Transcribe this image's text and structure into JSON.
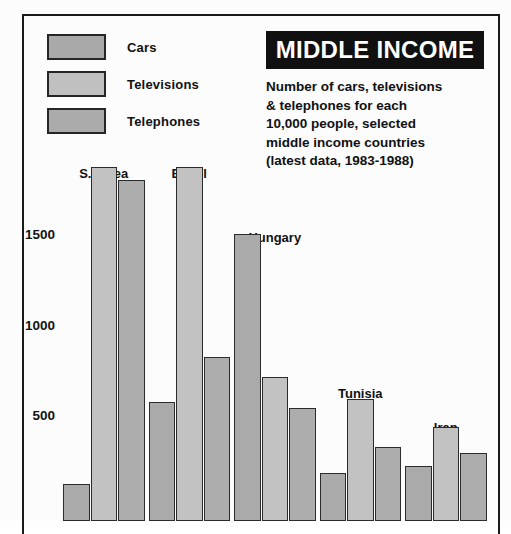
{
  "headline": {
    "title": "MIDDLE INCOME",
    "background": "#101010",
    "text_color": "#ffffff"
  },
  "subtitle": {
    "line1": "Number of cars, televisions",
    "line2": "& telephones for each",
    "line3": "10,000 people, selected",
    "line4": "middle income countries",
    "line5": "(latest data, 1983-1988)"
  },
  "legend": {
    "position": "top-left",
    "items": [
      {
        "label": "Cars",
        "color": "#a9a9a9",
        "swatch_name": "legend-swatch-cars"
      },
      {
        "label": "Televisions",
        "color": "#c0c0c0",
        "swatch_name": "legend-swatch-televisions"
      },
      {
        "label": "Telephones",
        "color": "#ababab",
        "swatch_name": "legend-swatch-telephones"
      }
    ]
  },
  "axis": {
    "yticks": [
      "500",
      "1000",
      "1500"
    ],
    "ytick_values": [
      500,
      1000,
      1500
    ]
  },
  "chart_data": {
    "type": "bar",
    "title": "MIDDLE INCOME",
    "subtitle": "Number of cars, televisions & telephones for each 10,000 people, selected middle income countries (latest data, 1983-1988)",
    "xlabel": "",
    "ylabel": "",
    "ylim": [
      0,
      1950
    ],
    "grid": false,
    "legend_position": "top-left",
    "categories": [
      "S.Korea",
      "Brazil",
      "Hungary",
      "Tunisia",
      "Iran"
    ],
    "series": [
      {
        "name": "Cars",
        "color": "#a9a9a9",
        "values": [
          115,
          570,
          1500,
          180,
          215
        ]
      },
      {
        "name": "Televisions",
        "color": "#c0c0c0",
        "values": [
          1870,
          1870,
          710,
          590,
          430
        ]
      },
      {
        "name": "Telephones",
        "color": "#ababab",
        "values": [
          1800,
          820,
          540,
          320,
          290
        ]
      }
    ]
  }
}
